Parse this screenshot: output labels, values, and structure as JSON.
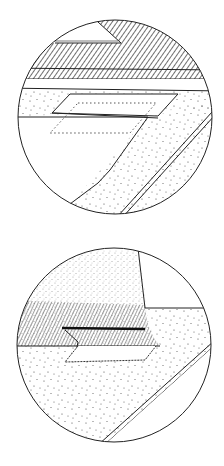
{
  "figure": {
    "background": "#ffffff",
    "stroke": "#222222",
    "panels": [
      {
        "id": "detail-top",
        "description": "Circular detail view: hatched band with triangular notch above, stippled surface with dashed rectangular outline and diagonal stippled strip bordered by a double line",
        "center": [
          115,
          117
        ],
        "radius": 97
      },
      {
        "id": "detail-bottom",
        "description": "Circular detail view: curved hatched/stippled region with heavy dark edge line, jagged outlined patch below, stippled field with diagonal double line",
        "center": [
          114,
          345
        ],
        "radius": 97
      }
    ]
  }
}
